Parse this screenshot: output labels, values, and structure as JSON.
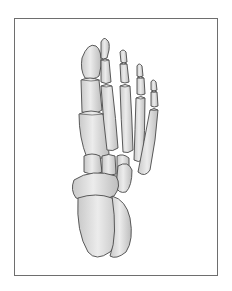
{
  "image": {
    "subject": "foot-skeleton-illustration",
    "view": "dorsal",
    "frame_color": "#6e6e6e",
    "bone_fill": "#dcdcdc",
    "bone_outline": "#4a4a4a",
    "background": "#ffffff"
  }
}
